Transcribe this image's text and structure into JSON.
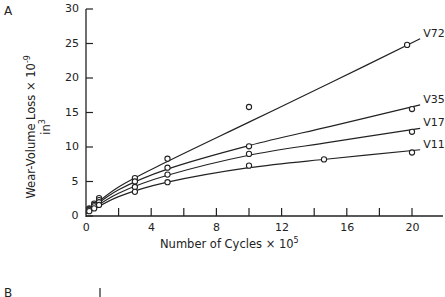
{
  "panel": {
    "label_a": "A",
    "label_b": "B"
  },
  "chart_data": {
    "type": "line",
    "title": "",
    "panel_label": "A",
    "xlabel": "Number of Cycles × 10^5",
    "xlabel_text": "Number of Cycles × 10",
    "xlabel_exp": "5",
    "ylabel": "Wear-Volume Loss × 10^-9 in^3",
    "ylabel_text": "Wear-Volume Loss × 10",
    "ylabel_exp": "-9",
    "ylabel_unit": "in",
    "ylabel_unit_exp": "3",
    "xlim": [
      0,
      21
    ],
    "ylim": [
      0,
      30
    ],
    "xticks": [
      0,
      4,
      8,
      12,
      16,
      20
    ],
    "xticks_minor": [
      2,
      6,
      10,
      14,
      18
    ],
    "yticks": [
      0,
      5,
      10,
      15,
      20,
      25,
      30
    ],
    "grid": false,
    "legend": "inline labels at line ends",
    "series": [
      {
        "name": "V72",
        "points": [
          [
            0.2,
            1.1
          ],
          [
            0.5,
            1.8
          ],
          [
            0.8,
            2.6
          ],
          [
            3.0,
            5.5
          ],
          [
            5.0,
            8.3
          ],
          [
            10.0,
            15.8
          ],
          [
            19.7,
            24.8
          ]
        ],
        "curve": [
          [
            0,
            0.6
          ],
          [
            2,
            4.2
          ],
          [
            5,
            7.9
          ],
          [
            10,
            13.6
          ],
          [
            15,
            19.3
          ],
          [
            20.5,
            25.7
          ]
        ]
      },
      {
        "name": "V35",
        "points": [
          [
            0.2,
            1.0
          ],
          [
            0.5,
            1.6
          ],
          [
            0.8,
            2.3
          ],
          [
            3.0,
            5.0
          ],
          [
            5.0,
            7.0
          ],
          [
            10.0,
            10.1
          ],
          [
            20.0,
            15.5
          ]
        ],
        "curve": [
          [
            0,
            0.5
          ],
          [
            2,
            3.8
          ],
          [
            5,
            6.8
          ],
          [
            10,
            10.2
          ],
          [
            15,
            13.0
          ],
          [
            20.5,
            16.1
          ]
        ]
      },
      {
        "name": "V17",
        "points": [
          [
            0.2,
            0.9
          ],
          [
            0.5,
            1.4
          ],
          [
            0.8,
            2.0
          ],
          [
            3.0,
            4.2
          ],
          [
            5.0,
            6.0
          ],
          [
            10.0,
            9.0
          ],
          [
            20.0,
            12.2
          ]
        ],
        "curve": [
          [
            0,
            0.4
          ],
          [
            2,
            3.3
          ],
          [
            5,
            5.9
          ],
          [
            10,
            8.8
          ],
          [
            15,
            10.7
          ],
          [
            20.5,
            12.7
          ]
        ]
      },
      {
        "name": "V11",
        "points": [
          [
            0.2,
            0.7
          ],
          [
            0.5,
            1.1
          ],
          [
            0.8,
            1.6
          ],
          [
            3.0,
            3.5
          ],
          [
            5.0,
            4.9
          ],
          [
            10.0,
            7.3
          ],
          [
            14.6,
            8.2
          ],
          [
            20.0,
            9.2
          ]
        ],
        "curve": [
          [
            0,
            0.3
          ],
          [
            2,
            2.8
          ],
          [
            5,
            4.9
          ],
          [
            10,
            7.0
          ],
          [
            15,
            8.3
          ],
          [
            20.5,
            9.6
          ]
        ]
      }
    ]
  }
}
